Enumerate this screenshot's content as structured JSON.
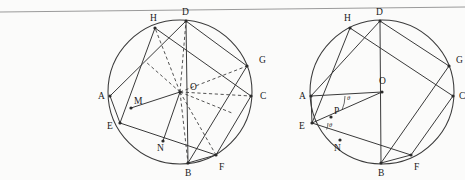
{
  "figure": {
    "background_color": "#fbfbfa",
    "stroke_color": "#3a3a3a",
    "rule_color": "#9a9a9a"
  },
  "page_rule": {
    "name": "page-edge-line",
    "x1": 0,
    "y1": 12,
    "x2": 465,
    "y2": 7
  },
  "left_circle": {
    "name": "left-figure",
    "center": {
      "cx": 180.0,
      "cy": 92.0,
      "label": "O",
      "label_x": 190.0,
      "label_y": 90.0
    },
    "radius": 72.0,
    "vertices": [
      {
        "id": "A",
        "x": 110.0,
        "y": 96.0,
        "label": "A",
        "label_x": 98.0,
        "label_y": 99.0
      },
      {
        "id": "E",
        "x": 120.0,
        "y": 123.0,
        "label": "E",
        "label_x": 107.0,
        "label_y": 129.0
      },
      {
        "id": "B",
        "x": 188.0,
        "y": 163.0,
        "label": "B",
        "label_x": 185.0,
        "label_y": 176.0
      },
      {
        "id": "F",
        "x": 216.0,
        "y": 155.0,
        "label": "F",
        "label_x": 219.0,
        "label_y": 170.0
      },
      {
        "id": "C",
        "x": 251.0,
        "y": 96.0,
        "label": "C",
        "label_x": 260.0,
        "label_y": 99.0
      },
      {
        "id": "G",
        "x": 247.0,
        "y": 66.0,
        "label": "G",
        "label_x": 259.0,
        "label_y": 63.0
      },
      {
        "id": "D",
        "x": 186.0,
        "y": 21.0,
        "label": "D",
        "label_x": 182.0,
        "label_y": 15.0
      },
      {
        "id": "H",
        "x": 155.0,
        "y": 28.0,
        "label": "H",
        "label_x": 150.0,
        "label_y": 21.0
      }
    ],
    "inner_points": [
      {
        "id": "M",
        "x": 131.0,
        "y": 108.0,
        "label": "M",
        "label_x": 134.0,
        "label_y": 104.0
      },
      {
        "id": "N",
        "x": 163.0,
        "y": 141.0,
        "label": "N",
        "label_x": 157.0,
        "label_y": 151.0
      },
      {
        "id": "K1",
        "x": 146.0,
        "y": 62.0,
        "label": "",
        "label_x": 0,
        "label_y": 0
      },
      {
        "id": "K2",
        "x": 171.0,
        "y": 35.0,
        "label": "",
        "label_x": 0,
        "label_y": 0
      },
      {
        "id": "K3",
        "x": 217.0,
        "y": 55.0,
        "label": "",
        "label_x": 0,
        "label_y": 0
      },
      {
        "id": "K4",
        "x": 232.0,
        "y": 113.0,
        "label": "",
        "label_x": 0,
        "label_y": 0
      },
      {
        "id": "K5",
        "x": 202.0,
        "y": 148.0,
        "label": "",
        "label_x": 0,
        "label_y": 0
      }
    ],
    "chords": [
      {
        "from": "A",
        "to": "D",
        "name": "chord-AD"
      },
      {
        "from": "A",
        "to": "E",
        "name": "chord-AE"
      },
      {
        "from": "H",
        "to": "E",
        "name": "chord-HE"
      },
      {
        "from": "H",
        "to": "C",
        "name": "chord-HC"
      },
      {
        "from": "D",
        "to": "G",
        "name": "chord-DG"
      },
      {
        "from": "D",
        "to": "B",
        "name": "chord-DB"
      },
      {
        "from": "E",
        "to": "F",
        "name": "chord-EF"
      },
      {
        "from": "G",
        "to": "B",
        "name": "chord-GB"
      },
      {
        "from": "C",
        "to": "F",
        "name": "chord-CF"
      },
      {
        "from": "B",
        "to": "F",
        "name": "chord-BF"
      },
      {
        "from": "M",
        "to": "O",
        "name": "segment-MO"
      },
      {
        "from": "N",
        "to": "O",
        "name": "segment-NO"
      }
    ],
    "dashed_radii": [
      {
        "to": "H",
        "name": "radius-OH"
      },
      {
        "to": "D",
        "name": "radius-OD"
      },
      {
        "to": "G",
        "name": "radius-OG"
      },
      {
        "to": "C",
        "name": "radius-OC"
      },
      {
        "to": "F",
        "name": "radius-OF"
      },
      {
        "to": "B",
        "name": "radius-OB"
      },
      {
        "to": "K1",
        "name": "radius-OK1"
      },
      {
        "to": "K4",
        "name": "radius-OK4"
      }
    ]
  },
  "right_circle": {
    "name": "right-figure",
    "center": {
      "cx": 382.0,
      "cy": 92.0,
      "label": "O",
      "label_x": 379.0,
      "label_y": 84.0
    },
    "radius": 72.0,
    "vertices": [
      {
        "id": "A",
        "x": 311.0,
        "y": 96.0,
        "label": "A",
        "label_x": 299.0,
        "label_y": 99.0
      },
      {
        "id": "E",
        "x": 312.0,
        "y": 123.0,
        "label": "E",
        "label_x": 299.0,
        "label_y": 129.0
      },
      {
        "id": "B",
        "x": 381.0,
        "y": 163.0,
        "label": "B",
        "label_x": 378.0,
        "label_y": 176.0
      },
      {
        "id": "F",
        "x": 411.0,
        "y": 155.0,
        "label": "F",
        "label_x": 414.0,
        "label_y": 170.0
      },
      {
        "id": "C",
        "x": 453.0,
        "y": 96.0,
        "label": "C",
        "label_x": 459.0,
        "label_y": 99.0
      },
      {
        "id": "G",
        "x": 449.0,
        "y": 66.0,
        "label": "G",
        "label_x": 456.0,
        "label_y": 63.0
      },
      {
        "id": "D",
        "x": 380.0,
        "y": 21.0,
        "label": "D",
        "label_x": 376.0,
        "label_y": 15.0
      },
      {
        "id": "H",
        "x": 350.0,
        "y": 28.0,
        "label": "H",
        "label_x": 344.0,
        "label_y": 21.0
      }
    ],
    "inner_points": [
      {
        "id": "N",
        "x": 340.0,
        "y": 140.0,
        "label": "N",
        "label_x": 334.0,
        "label_y": 151.0
      },
      {
        "id": "P",
        "x": 331.0,
        "y": 117.0,
        "label": "P",
        "label_x": 334.0,
        "label_y": 114.0
      }
    ],
    "chords": [
      {
        "from": "A",
        "to": "O",
        "name": "segment-AO"
      },
      {
        "from": "E",
        "to": "O",
        "name": "segment-EO"
      },
      {
        "from": "A",
        "to": "D",
        "name": "chord-AD"
      },
      {
        "from": "A",
        "to": "E",
        "name": "chord-AE"
      },
      {
        "from": "H",
        "to": "E",
        "name": "chord-HE"
      },
      {
        "from": "H",
        "to": "C",
        "name": "chord-HC"
      },
      {
        "from": "D",
        "to": "G",
        "name": "chord-DG"
      },
      {
        "from": "D",
        "to": "B",
        "name": "chord-DB"
      },
      {
        "from": "E",
        "to": "F",
        "name": "chord-EF"
      },
      {
        "from": "G",
        "to": "B",
        "name": "chord-GB"
      },
      {
        "from": "C",
        "to": "F",
        "name": "chord-CF"
      },
      {
        "from": "B",
        "to": "F",
        "name": "chord-BF"
      }
    ],
    "angles": [
      {
        "id": "theta-at-A",
        "label": "θ",
        "label_x": 347.0,
        "label_y": 100.0,
        "vertex": "A",
        "arc_cx": 311.0,
        "arc_cy": 96.0,
        "arc_r": 34.0
      },
      {
        "id": "theta-at-E",
        "label": "θ",
        "label_x": 329.0,
        "label_y": 127.0,
        "vertex": "E",
        "arc_cx": 312.0,
        "arc_cy": 123.0,
        "arc_r": 16.0
      }
    ]
  }
}
